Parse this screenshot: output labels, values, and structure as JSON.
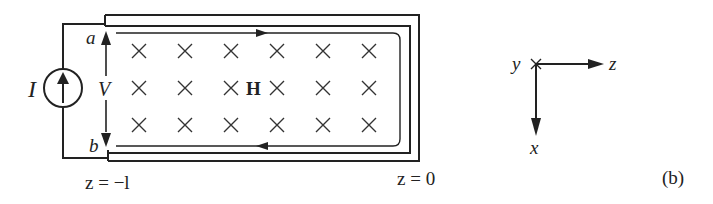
{
  "figure": {
    "panel_label": "(b)",
    "colors": {
      "ink": "#222222",
      "background": "#ffffff"
    }
  },
  "circuit": {
    "source_label": "I",
    "voltage_label": "V",
    "terminal_a": "a",
    "terminal_b": "b",
    "field_label": "H",
    "left_end_label": "z = −l",
    "right_end_label": "z = 0",
    "field_marks": {
      "rows": 3,
      "cols": 6,
      "symbol": "×",
      "meaning": "field into page"
    }
  },
  "axes": {
    "y_label": "y",
    "z_label": "z",
    "x_label": "x"
  }
}
